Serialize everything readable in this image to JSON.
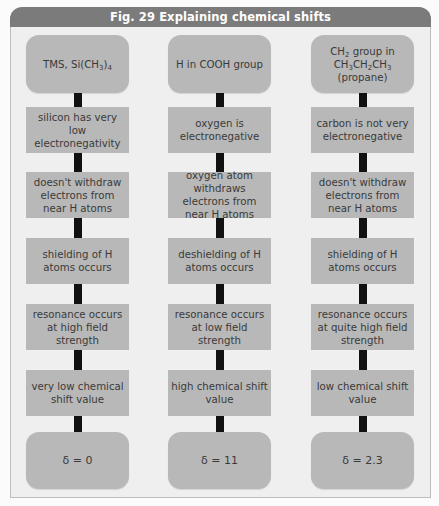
{
  "figure": {
    "title": "Fig. 29  Explaining chemical shifts"
  },
  "columns": [
    {
      "start": "TMS, Si(CH3)4",
      "steps": [
        "silicon has very low electronegativity",
        "doesn't withdraw electrons from near H atoms",
        "shielding of H atoms occurs",
        "resonance occurs at high field strength",
        "very low chemical shift value"
      ],
      "result": "δ = 0"
    },
    {
      "start": "H in COOH group",
      "steps": [
        "oxygen is electronegative",
        "oxygen atom withdraws electrons from near H atoms",
        "deshielding of H atoms occurs",
        "resonance occurs at low field strength",
        "high chemical shift value"
      ],
      "result": "δ = 11"
    },
    {
      "start": "CH2 group in CH3CH2CH3 (propane)",
      "steps": [
        "carbon is not very electronegative",
        "doesn't withdraw electrons from near H atoms",
        "shielding of H atoms occurs",
        "resonance occurs at quite high field strength",
        "low chemical shift value"
      ],
      "result": "δ = 2.3"
    }
  ],
  "colors": {
    "header": "#7b7b7b",
    "panel": "#efefef",
    "box": "#b8b8b8",
    "connector": "#111111"
  }
}
